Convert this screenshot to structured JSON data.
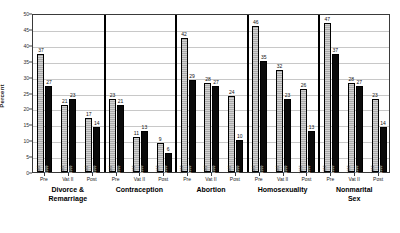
{
  "chart_data": {
    "type": "bar",
    "title": "",
    "xlabel": "",
    "ylabel": "Percent",
    "ylim": [
      0,
      50
    ],
    "yticks": [
      0,
      5,
      10,
      15,
      20,
      25,
      30,
      35,
      40,
      45,
      50
    ],
    "grid": true,
    "legend_position": "none",
    "categories": [
      "Divorce & Remarriage",
      "Contraception",
      "Abortion",
      "Homosexuality",
      "Nonmarital Sex"
    ],
    "subcategories": [
      "Pre",
      "Vat II",
      "Post"
    ],
    "series": [
      {
        "name": "1987",
        "pattern": "light-hatched",
        "color": "#c4c4c4"
      },
      {
        "name": "1999",
        "pattern": "solid-black",
        "color": "#0a0a0a"
      }
    ],
    "groups": [
      {
        "label": "Divorce &\nRemarriage",
        "cohorts": [
          {
            "label": "Pre",
            "values": [
              37,
              27
            ],
            "year_labels": [
              "1987",
              "1999"
            ]
          },
          {
            "label": "Vat II",
            "values": [
              21,
              23
            ],
            "year_labels": [
              "1987",
              "1999"
            ]
          },
          {
            "label": "Post",
            "values": [
              17,
              14
            ],
            "year_labels": [
              "1987",
              "1999"
            ]
          }
        ]
      },
      {
        "label": "Contraception",
        "cohorts": [
          {
            "label": "Pre",
            "values": [
              23,
              21
            ],
            "year_labels": [
              "1987",
              "1999"
            ]
          },
          {
            "label": "Vat II",
            "values": [
              11,
              13
            ],
            "year_labels": [
              "1987",
              "1999"
            ]
          },
          {
            "label": "Post",
            "values": [
              9,
              6
            ],
            "year_labels": [
              "1987",
              "1999"
            ]
          }
        ]
      },
      {
        "label": "Abortion",
        "cohorts": [
          {
            "label": "Pre",
            "values": [
              42,
              29
            ],
            "year_labels": [
              "1987",
              "1999"
            ]
          },
          {
            "label": "Vat II",
            "values": [
              28,
              27
            ],
            "year_labels": [
              "1987",
              "1999"
            ]
          },
          {
            "label": "Post",
            "values": [
              24,
              10
            ],
            "year_labels": [
              "1987",
              "1999"
            ]
          }
        ]
      },
      {
        "label": "Homosexuality",
        "cohorts": [
          {
            "label": "Pre",
            "values": [
              46,
              35
            ],
            "year_labels": [
              "1987",
              "1999"
            ]
          },
          {
            "label": "Vat II",
            "values": [
              32,
              23
            ],
            "year_labels": [
              "1987",
              "1999"
            ]
          },
          {
            "label": "Post",
            "values": [
              26,
              13
            ],
            "year_labels": [
              "1987",
              "1999"
            ]
          }
        ]
      },
      {
        "label": "Nonmarital Sex",
        "cohorts": [
          {
            "label": "Pre",
            "values": [
              47,
              37
            ],
            "year_labels": [
              "1987",
              "1999"
            ]
          },
          {
            "label": "Vat II",
            "values": [
              28,
              27
            ],
            "year_labels": [
              "1987",
              "1999"
            ]
          },
          {
            "label": "Post",
            "values": [
              23,
              14
            ],
            "year_labels": [
              "1987",
              "1999"
            ]
          }
        ]
      }
    ]
  }
}
